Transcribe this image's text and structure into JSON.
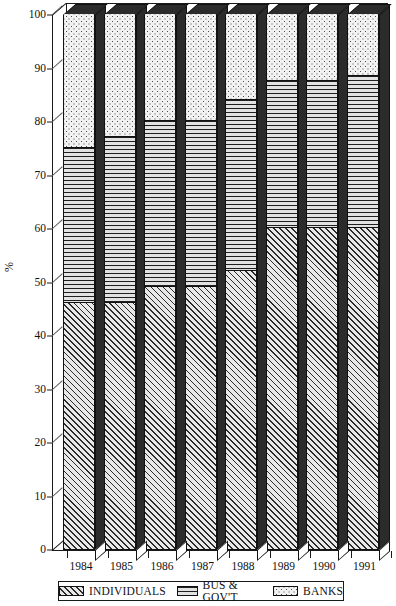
{
  "chart_data": {
    "type": "bar",
    "subtype": "stacked-bar-100-percent-3d",
    "title": "",
    "subtitle": "",
    "xlabel": "",
    "ylabel": "%",
    "ylim": [
      0,
      100
    ],
    "yticks": [
      0,
      10,
      20,
      30,
      40,
      50,
      60,
      70,
      80,
      90,
      100
    ],
    "ytick_labels": [
      "0",
      "10",
      "20",
      "30",
      "40",
      "50",
      "60",
      "70",
      "80",
      "90",
      "100"
    ],
    "grid": false,
    "legend_position": "bottom",
    "categories": [
      "1984",
      "1985",
      "1986",
      "1987",
      "1988",
      "1989",
      "1990",
      "1991"
    ],
    "series": [
      {
        "name": "INDIVIDUALS",
        "pattern": "diagonal-hatch",
        "values": [
          46,
          46,
          49,
          49,
          52,
          60,
          60,
          60
        ]
      },
      {
        "name": "BUS & GOV'T",
        "pattern": "horizontal-lines",
        "values": [
          29,
          31,
          31,
          31,
          32,
          27.5,
          27.5,
          28.5
        ]
      },
      {
        "name": "BANKS",
        "pattern": "dotted",
        "values": [
          25,
          23,
          20,
          20,
          16,
          12.5,
          12.5,
          11.5
        ]
      }
    ],
    "cumulative_tops": [
      [
        46,
        75,
        100
      ],
      [
        46,
        77,
        100
      ],
      [
        49,
        80,
        100
      ],
      [
        49,
        80,
        100
      ],
      [
        52,
        84,
        100
      ],
      [
        60,
        87.5,
        100
      ],
      [
        60,
        87.5,
        100
      ],
      [
        60,
        88.5,
        100
      ]
    ]
  },
  "legend": {
    "items": [
      {
        "label": "INDIVIDUALS",
        "swatch": "diagonal-hatch-swatch"
      },
      {
        "label": "BUS & GOV'T",
        "swatch": "horizontal-lines-swatch"
      },
      {
        "label": "BANKS",
        "swatch": "dotted-swatch"
      }
    ]
  }
}
